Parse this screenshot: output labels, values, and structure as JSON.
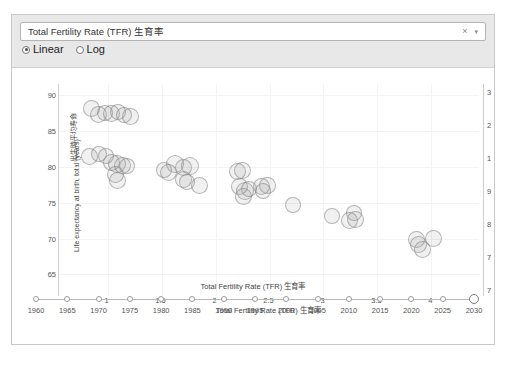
{
  "card": {
    "combo": {
      "value": "Total Fertility Rate (TFR) 生育率",
      "clear_icon": "×",
      "caret_icon": "▾"
    },
    "scale_options": [
      {
        "label": "Linear",
        "selected": true
      },
      {
        "label": "Log",
        "selected": false
      }
    ]
  },
  "chart_data": {
    "type": "scatter",
    "title": "",
    "xlabel": "Total Fertility Rate (TFR) 生育率",
    "ylabel": "Life expectancy at birth, total (years) 管理均寿命",
    "ylabel_latin": "Life expectancy at birth, total (years)",
    "ylabel_cjk": "出生時平均寿命",
    "xlim": [
      0.55,
      4.45
    ],
    "ylim": [
      62.0,
      91.5
    ],
    "xticks": [
      1,
      1.5,
      2,
      2.5,
      3,
      3.5,
      4
    ],
    "xtick_labels": [
      "1",
      "1.5",
      "2",
      "2.5",
      "3",
      "3.5",
      "4"
    ],
    "yticks": [
      65,
      70,
      75,
      80,
      85,
      90
    ],
    "ytick_labels": [
      "65",
      "70",
      "75",
      "80",
      "85",
      "90"
    ],
    "right_axis_labels": [
      "3",
      "2",
      "1",
      "9",
      "8",
      "7",
      "7"
    ],
    "grid": true,
    "legend": false,
    "marker": {
      "fill": "#96969621",
      "stroke": "#82828290",
      "shape": "circle"
    },
    "points": [
      {
        "x": 0.85,
        "y": 88.1,
        "r": 8.5
      },
      {
        "x": 0.92,
        "y": 87.3,
        "r": 8.5
      },
      {
        "x": 0.98,
        "y": 87.5,
        "r": 8.0
      },
      {
        "x": 1.04,
        "y": 87.4,
        "r": 8.5
      },
      {
        "x": 1.1,
        "y": 87.6,
        "r": 8.0
      },
      {
        "x": 1.15,
        "y": 87.2,
        "r": 8.0
      },
      {
        "x": 1.21,
        "y": 87.0,
        "r": 8.5
      },
      {
        "x": 0.83,
        "y": 81.4,
        "r": 8.5
      },
      {
        "x": 0.92,
        "y": 81.8,
        "r": 8.0
      },
      {
        "x": 0.99,
        "y": 81.5,
        "r": 8.0
      },
      {
        "x": 1.04,
        "y": 80.6,
        "r": 8.5
      },
      {
        "x": 1.09,
        "y": 80.3,
        "r": 9.0
      },
      {
        "x": 1.14,
        "y": 80.2,
        "r": 8.5
      },
      {
        "x": 1.18,
        "y": 80.1,
        "r": 8.0
      },
      {
        "x": 1.07,
        "y": 78.9,
        "r": 8.5
      },
      {
        "x": 1.09,
        "y": 78.1,
        "r": 8.5
      },
      {
        "x": 1.52,
        "y": 79.5,
        "r": 8.0
      },
      {
        "x": 1.56,
        "y": 79.2,
        "r": 8.5
      },
      {
        "x": 1.62,
        "y": 80.4,
        "r": 9.0
      },
      {
        "x": 1.7,
        "y": 79.9,
        "r": 8.5
      },
      {
        "x": 1.76,
        "y": 80.1,
        "r": 9.0
      },
      {
        "x": 1.7,
        "y": 78.2,
        "r": 8.5
      },
      {
        "x": 1.74,
        "y": 77.9,
        "r": 8.0
      },
      {
        "x": 1.85,
        "y": 77.4,
        "r": 8.5
      },
      {
        "x": 2.2,
        "y": 79.3,
        "r": 8.5
      },
      {
        "x": 2.25,
        "y": 79.5,
        "r": 8.5
      },
      {
        "x": 2.22,
        "y": 77.2,
        "r": 8.5
      },
      {
        "x": 2.27,
        "y": 76.6,
        "r": 9.0
      },
      {
        "x": 2.26,
        "y": 75.9,
        "r": 8.5
      },
      {
        "x": 2.31,
        "y": 76.9,
        "r": 8.0
      },
      {
        "x": 2.43,
        "y": 77.3,
        "r": 8.5
      },
      {
        "x": 2.48,
        "y": 77.4,
        "r": 8.5
      },
      {
        "x": 2.44,
        "y": 76.6,
        "r": 8.0
      },
      {
        "x": 2.72,
        "y": 74.6,
        "r": 8.0
      },
      {
        "x": 3.08,
        "y": 73.2,
        "r": 8.0
      },
      {
        "x": 3.28,
        "y": 73.5,
        "r": 8.0
      },
      {
        "x": 3.24,
        "y": 72.5,
        "r": 8.5
      },
      {
        "x": 3.3,
        "y": 72.6,
        "r": 8.5
      },
      {
        "x": 3.86,
        "y": 69.9,
        "r": 8.5
      },
      {
        "x": 3.88,
        "y": 69.1,
        "r": 8.5
      },
      {
        "x": 3.92,
        "y": 68.5,
        "r": 8.5
      },
      {
        "x": 4.02,
        "y": 70.0,
        "r": 8.5
      }
    ]
  },
  "timeline": {
    "title": "Total Fertility Rate (TFR) 生育率",
    "ticks": [
      "1960",
      "1965",
      "1970",
      "1975",
      "1980",
      "1985",
      "1990",
      "1995",
      "2000",
      "2005",
      "2010",
      "2015",
      "2020",
      "2025",
      "2030"
    ],
    "selected": "2030"
  }
}
